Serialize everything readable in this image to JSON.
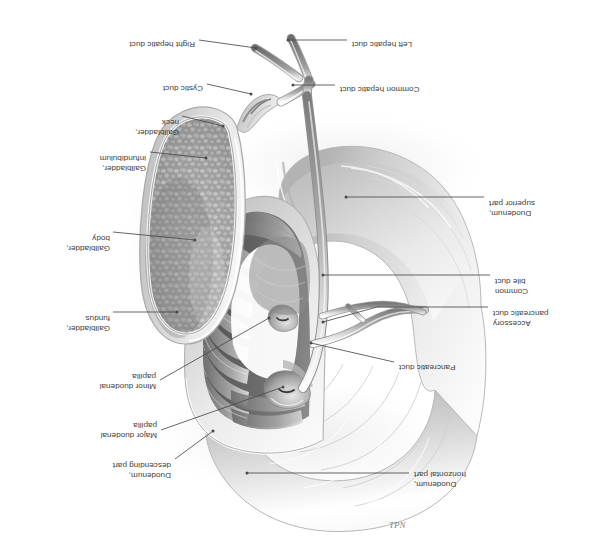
{
  "figure": {
    "orientation": "rotated-180",
    "background_color": "#ffffff",
    "ink_color": "#3b3b3b",
    "signature": "TPN"
  },
  "labels": [
    {
      "id": "duodenum-horizontal-part",
      "lines": [
        "Duodenum,",
        "horizontal part"
      ],
      "side": "left",
      "text_x": 185,
      "text_y": 69,
      "leader": [
        [
          190,
          85
        ],
        [
          352,
          85
        ]
      ]
    },
    {
      "id": "pancreatic-duct",
      "lines": [
        "Pancreatic duct"
      ],
      "side": "left",
      "text_x": 200,
      "text_y": 186,
      "leader": [
        [
          205,
          196
        ],
        [
          288,
          215
        ]
      ]
    },
    {
      "id": "accessory-pancreatic-duct",
      "lines": [
        "Accessory",
        "pancreatic duct"
      ],
      "side": "left",
      "text_x": 106,
      "text_y": 230,
      "leader": [
        [
          111,
          251
        ],
        [
          222,
          251
        ],
        [
          276,
          236
        ]
      ]
    },
    {
      "id": "common-bile-duct",
      "lines": [
        "Common",
        "bile duct"
      ],
      "side": "left",
      "text_x": 104,
      "text_y": 262,
      "leader": [
        [
          109,
          283
        ],
        [
          276,
          283
        ]
      ]
    },
    {
      "id": "duodenum-superior-part",
      "lines": [
        "Duodenum,",
        "superior part"
      ],
      "side": "left",
      "text_x": 110,
      "text_y": 340,
      "leader": [
        [
          115,
          361
        ],
        [
          253,
          361
        ]
      ]
    },
    {
      "id": "common-hepatic-duct",
      "lines": [
        "Common hepatic duct"
      ],
      "side": "left",
      "text_x": 259,
      "text_y": 464,
      "leader": [
        [
          264,
          473
        ],
        [
          306,
          473
        ]
      ]
    },
    {
      "id": "left-hepatic-duct",
      "lines": [
        "Left hepatic duct"
      ],
      "side": "left",
      "text_x": 247,
      "text_y": 509,
      "leader": [
        [
          252,
          518
        ],
        [
          311,
          518
        ]
      ]
    },
    {
      "id": "duodenum-descending-part",
      "lines": [
        "Duodenum,",
        "descending part"
      ],
      "side": "right",
      "text_x": 428,
      "text_y": 78,
      "leader": [
        [
          424,
          99
        ],
        [
          386,
          127
        ]
      ]
    },
    {
      "id": "major-duodenal-papilla",
      "lines": [
        "Major duodenal",
        "papilla"
      ],
      "side": "right",
      "text_x": 442,
      "text_y": 118,
      "leader": [
        [
          438,
          128
        ],
        [
          316,
          171
        ]
      ]
    },
    {
      "id": "minor-duodenal-papilla",
      "lines": [
        "Minor duodenal",
        "papilla"
      ],
      "side": "right",
      "text_x": 443,
      "text_y": 167,
      "leader": [
        [
          439,
          178
        ],
        [
          330,
          240
        ]
      ]
    },
    {
      "id": "gallbladder-fundus",
      "lines": [
        "Gallbladder,",
        "fundus"
      ],
      "side": "right",
      "text_x": 489,
      "text_y": 225,
      "leader": [
        [
          486,
          246
        ],
        [
          422,
          246
        ]
      ]
    },
    {
      "id": "gallbladder-body",
      "lines": [
        "Gallbladder,",
        "body"
      ],
      "side": "right",
      "text_x": 489,
      "text_y": 305,
      "leader": [
        [
          486,
          326
        ],
        [
          404,
          318
        ]
      ]
    },
    {
      "id": "gallbladder-infundibulum",
      "lines": [
        "Gallbladder,",
        "infundibulum"
      ],
      "side": "right",
      "text_x": 453,
      "text_y": 385,
      "leader": [
        [
          449,
          406
        ],
        [
          393,
          400
        ]
      ]
    },
    {
      "id": "gallbladder-neck",
      "lines": [
        "Gallbladder,",
        "neck"
      ],
      "side": "right",
      "text_x": 420,
      "text_y": 421,
      "leader": [
        [
          417,
          442
        ],
        [
          376,
          432
        ]
      ]
    },
    {
      "id": "cystic-duct",
      "lines": [
        "Cystic duct"
      ],
      "side": "right",
      "text_x": 396,
      "text_y": 465,
      "leader": [
        [
          392,
          474
        ],
        [
          348,
          464
        ]
      ]
    },
    {
      "id": "right-hepatic-duct",
      "lines": [
        "Right hepatic duct"
      ],
      "side": "right",
      "text_x": 404,
      "text_y": 509,
      "leader": [
        [
          400,
          518
        ],
        [
          343,
          510
        ]
      ]
    }
  ],
  "structures": {
    "duodenum_descending": "descending duodenum opened to show plicae circulares",
    "duodenum_superior": "superior (first) part of duodenum",
    "duodenum_horizontal": "horizontal (third) part of duodenum",
    "gallbladder": "gallbladder sectioned to show reticulated mucosa",
    "ducts": "biliary tree: right and left hepatic ducts, common hepatic duct, cystic duct, common bile duct, pancreatic and accessory pancreatic ducts"
  }
}
